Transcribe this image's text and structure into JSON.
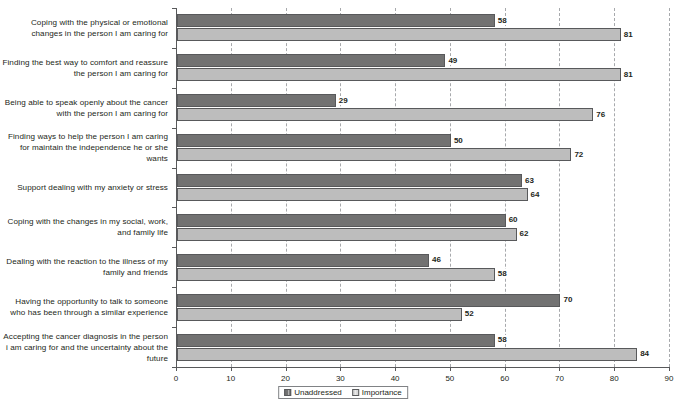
{
  "chart_data": {
    "type": "bar",
    "orientation": "horizontal",
    "title": "",
    "xlabel": "",
    "ylabel": "",
    "xlim": [
      0,
      90
    ],
    "xticks": [
      0,
      10,
      20,
      30,
      40,
      50,
      60,
      70,
      80,
      90
    ],
    "grid": "vertical-dashed",
    "legend_position": "bottom-center",
    "categories": [
      "Coping with the physical or emotional changes in the person I am caring for",
      "Finding the best way to comfort and reassure the person I am caring for",
      "Being able to speak openly about the cancer with the person I am caring for",
      "Finding ways to help the person I am caring for maintain the independence he or she wants",
      "Support dealing with my anxiety or stress",
      "Coping with the changes in my social, work, and family life",
      "Dealing with the reaction to the illness of my family and friends",
      "Having the opportunity to talk to someone who has been through a similar experience",
      "Accepting the cancer diagnosis in the person i am caring for and the uncertainty about the future"
    ],
    "series": [
      {
        "name": "Unaddressed",
        "color": "#727272",
        "values": [
          58,
          49,
          29,
          50,
          63,
          60,
          46,
          70,
          58
        ]
      },
      {
        "name": "Importance",
        "color": "#bdbdbd",
        "values": [
          81,
          81,
          76,
          72,
          64,
          62,
          58,
          52,
          84
        ]
      }
    ]
  }
}
